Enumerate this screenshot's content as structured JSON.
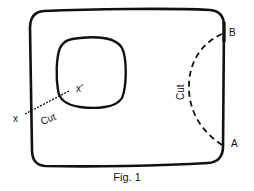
{
  "figure": {
    "caption": "Fig. 1",
    "colors": {
      "stroke": "#111111",
      "background": "#ffffff"
    },
    "shapes": {
      "outer_region": {
        "type": "rounded-rectangle",
        "style": "solid"
      },
      "inner_hole": {
        "type": "rounded-square",
        "style": "solid"
      }
    },
    "cuts": [
      {
        "id": "cut-xx",
        "style": "dotted-line",
        "label": "Cut",
        "endpoints": [
          "x",
          "x′"
        ]
      },
      {
        "id": "cut-ab",
        "style": "dashed-arc",
        "label": "Cut",
        "endpoints": [
          "A",
          "B"
        ]
      }
    ],
    "labels": {
      "x": "x",
      "x_prime": "x′",
      "a": "A",
      "b": "B",
      "cut_left": "Cut",
      "cut_right": "Cut"
    }
  }
}
